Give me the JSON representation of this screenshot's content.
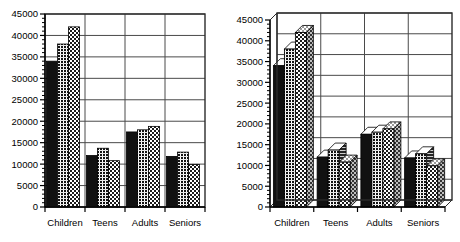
{
  "chart_data": [
    {
      "type": "bar",
      "title": "",
      "subtitle": "",
      "xlabel": "",
      "ylabel": "",
      "style": "2d-grouped-bar",
      "categories": [
        "Children",
        "Teens",
        "Adults",
        "Seniors"
      ],
      "series": [
        {
          "name": "Series 1",
          "pattern": "solid-black",
          "values": [
            34000,
            12000,
            17500,
            11800
          ]
        },
        {
          "name": "Series 2",
          "pattern": "fine-grid",
          "values": [
            38000,
            13700,
            18000,
            12800
          ]
        },
        {
          "name": "Series 3",
          "pattern": "checker",
          "values": [
            42000,
            10800,
            18800,
            9900
          ]
        }
      ],
      "ylim": [
        0,
        45000
      ],
      "ytick_values": [
        0,
        5000,
        10000,
        15000,
        20000,
        25000,
        30000,
        35000,
        40000,
        45000
      ],
      "ytick_labels": [
        "0",
        "5000",
        "10000",
        "15000",
        "20000",
        "25000",
        "30000",
        "35000",
        "40000",
        "45000"
      ],
      "minor_ticks": true,
      "grid": "horizontal-and-category-separators",
      "legend": "none"
    },
    {
      "type": "bar",
      "title": "",
      "subtitle": "",
      "xlabel": "",
      "ylabel": "",
      "style": "3d-grouped-bar",
      "categories": [
        "Children",
        "Teens",
        "Adults",
        "Seniors"
      ],
      "series": [
        {
          "name": "Series 1",
          "pattern": "solid-black",
          "values": [
            34000,
            12000,
            17500,
            11800
          ]
        },
        {
          "name": "Series 2",
          "pattern": "fine-grid",
          "values": [
            38000,
            13700,
            18000,
            12800
          ]
        },
        {
          "name": "Series 3",
          "pattern": "checker",
          "values": [
            42000,
            10800,
            18800,
            9900
          ]
        }
      ],
      "ylim": [
        0,
        45000
      ],
      "ytick_values": [
        0,
        5000,
        10000,
        15000,
        20000,
        25000,
        30000,
        35000,
        40000,
        45000
      ],
      "ytick_labels": [
        "0",
        "5000",
        "10000",
        "15000",
        "20000",
        "25000",
        "30000",
        "35000",
        "40000",
        "45000"
      ],
      "minor_ticks": true,
      "grid": "horizontal-and-category-separators",
      "legend": "none"
    }
  ],
  "colors": {
    "axis": "#000000",
    "grid": "#4a4a4a",
    "frame": "#2b2b2b",
    "bar_solid": "#111111",
    "bar_fine": "#1a1a1a",
    "bar_checker": "#4d4d4d",
    "background": "#ffffff",
    "face_3d_top": "#8c8c8c",
    "face_3d_side": "#5a5a5a"
  }
}
